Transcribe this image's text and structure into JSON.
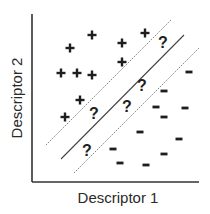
{
  "diagram": {
    "type": "svm-classification-scatter",
    "axes": {
      "xlabel": "Descriptor 1",
      "ylabel": "Descriptor 2",
      "origin": [
        32,
        182
      ],
      "x_end": 199,
      "y_end": 14
    },
    "boundaries": [
      {
        "name": "upper-margin",
        "style": "dotted",
        "x1": 46,
        "y1": 145,
        "x2": 171,
        "y2": 20
      },
      {
        "name": "decision-boundary",
        "style": "solid",
        "x1": 61,
        "y1": 159,
        "x2": 184,
        "y2": 35
      },
      {
        "name": "lower-margin",
        "style": "dotted",
        "x1": 74,
        "y1": 173,
        "x2": 199,
        "y2": 48
      }
    ],
    "classes": {
      "positive": {
        "symbol": "+",
        "points": [
          [
            92,
            35
          ],
          [
            70,
            48
          ],
          [
            122,
            43
          ],
          [
            145,
            33
          ],
          [
            122,
            62
          ],
          [
            61,
            73
          ],
          [
            77,
            73
          ],
          [
            92,
            75
          ],
          [
            80,
            100
          ],
          [
            65,
            117
          ]
        ]
      },
      "unknown": {
        "symbol": "?",
        "points": [
          [
            163,
            42
          ],
          [
            142,
            85
          ],
          [
            127,
            106
          ],
          [
            94,
            113
          ],
          [
            87,
            150
          ]
        ]
      },
      "negative": {
        "symbol": "-",
        "points": [
          [
            189,
            72
          ],
          [
            164,
            91
          ],
          [
            156,
            107
          ],
          [
            185,
            108
          ],
          [
            164,
            117
          ],
          [
            140,
            132
          ],
          [
            179,
            139
          ],
          [
            113,
            149
          ],
          [
            164,
            154
          ],
          [
            120,
            163
          ],
          [
            146,
            165
          ]
        ]
      }
    },
    "colors": {
      "ink": "#1e1e1e",
      "axis": "#333333",
      "background": "#ffffff"
    }
  }
}
